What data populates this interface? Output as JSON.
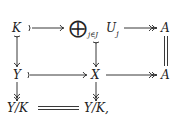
{
  "diagram": {
    "type": "commutative-diagram",
    "nodes": {
      "K": "K",
      "oplus_symbol": "⨁",
      "oplus_index": "j∈J",
      "U": "U",
      "U_sub": "j",
      "A_top": "A",
      "Y": "Y",
      "X": "X",
      "A_mid": "A",
      "YK_left": "Y/K",
      "YK_right": "Y/K,"
    },
    "arrows": [
      {
        "from": "K",
        "to": "⊕_{j∈J} U_j",
        "style": "mono"
      },
      {
        "from": "⊕_{j∈J} U_j",
        "to": "A",
        "style": "epi"
      },
      {
        "from": "K",
        "to": "Y",
        "style": "mono"
      },
      {
        "from": "⊕_{j∈J} U_j",
        "to": "X",
        "style": "mono"
      },
      {
        "from": "A",
        "to": "A",
        "style": "equal"
      },
      {
        "from": "Y",
        "to": "X",
        "style": "mono"
      },
      {
        "from": "X",
        "to": "A",
        "style": "epi"
      },
      {
        "from": "Y",
        "to": "Y/K",
        "style": "epi"
      },
      {
        "from": "X",
        "to": "Y/K",
        "style": "epi"
      },
      {
        "from": "Y/K",
        "to": "Y/K",
        "style": "equal"
      }
    ]
  }
}
